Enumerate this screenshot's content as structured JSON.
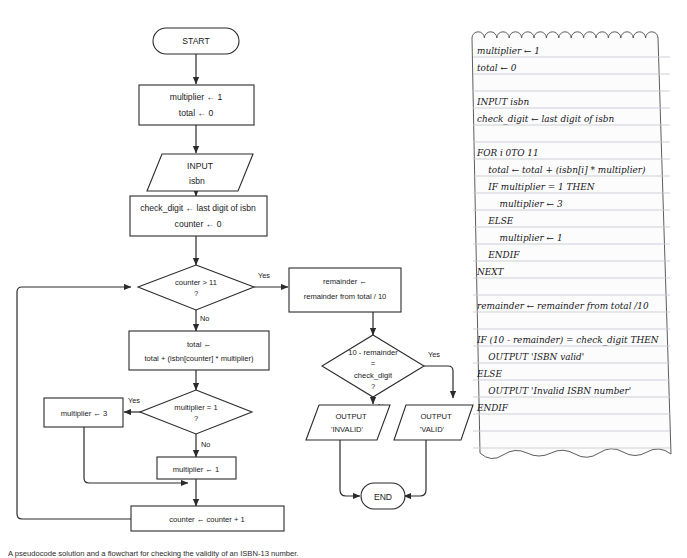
{
  "figure": {
    "caption": "A pseudocode solution and a flowchart for checking the validity of an ISBN-13 number.",
    "background_color": "#ffffff",
    "line_color": "#2b2b2b"
  },
  "flowchart": {
    "title": "ISBN-13 validity flowchart",
    "nodes": {
      "start": {
        "shape": "terminator",
        "text": "START"
      },
      "init": {
        "shape": "process",
        "line1": "multiplier ← 1",
        "line2": "total ← 0"
      },
      "input_isbn": {
        "shape": "io",
        "line1": "INPUT",
        "line2": "isbn"
      },
      "check_digit": {
        "shape": "process",
        "line1": "check_digit  ← last digit of isbn",
        "line2": "counter ← 0"
      },
      "counter_test": {
        "shape": "decision",
        "line1": "counter > 11",
        "line2": "?"
      },
      "remainder": {
        "shape": "process",
        "line1": "remainder ←",
        "line2": "remainder from total / 10"
      },
      "total_update": {
        "shape": "process",
        "line1": "total ←",
        "line2": "total + (isbn[counter] * multiplier)"
      },
      "mult_test": {
        "shape": "decision",
        "line1": "multiplier = 1",
        "line2": "?"
      },
      "mult_three": {
        "shape": "process",
        "line1": "multiplier ← 3"
      },
      "mult_one": {
        "shape": "process",
        "line1": "multiplier ← 1"
      },
      "counter_inc": {
        "shape": "process",
        "line1": "counter ← counter + 1"
      },
      "digit_test": {
        "shape": "decision",
        "line1": "10 - remainder",
        "line2": "=",
        "line3": "check_digit",
        "line4": "?"
      },
      "out_invalid": {
        "shape": "io",
        "line1": "OUTPUT",
        "line2": "'INVALID'"
      },
      "out_valid": {
        "shape": "io",
        "line1": "OUTPUT",
        "line2": "'VALID'"
      },
      "end": {
        "shape": "terminator",
        "text": "END"
      }
    },
    "edge_labels": {
      "counter_test_yes": "Yes",
      "counter_test_no": "No",
      "mult_test_yes": "Yes",
      "mult_test_no": "No",
      "digit_test_yes": "Yes",
      "digit_test_no": "No"
    }
  },
  "pseudocode_note": {
    "paper_color": "#fcfcfc",
    "rule_color": "#c9ccd2",
    "lines": [
      "multiplier ← 1",
      "total ← 0",
      "",
      "INPUT isbn",
      "check_digit ← last digit of isbn",
      "",
      "FOR i 0TO 11",
      "    total ← total + (isbn[i] * multiplier)",
      "    IF multiplier = 1 THEN",
      "        multiplier ← 3",
      "    ELSE",
      "        multiplier ← 1",
      "    ENDIF",
      "NEXT",
      "",
      "remainder ← remainder from total /10",
      "",
      "IF (10 - remainder) = check_digit THEN",
      "    OUTPUT 'ISBN valid'",
      "ELSE",
      "    OUTPUT 'Invalid ISBN number'",
      "ENDIF"
    ]
  }
}
